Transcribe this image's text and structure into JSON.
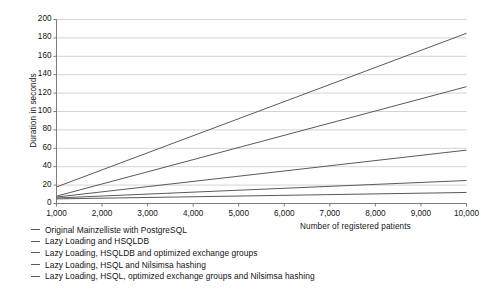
{
  "chart_data": {
    "type": "line",
    "title": "",
    "xlabel": "Number of registered patients",
    "ylabel": "Duration in seconds",
    "xlim": [
      1000,
      10000
    ],
    "ylim": [
      0,
      200
    ],
    "grid": true,
    "legend_position": "below",
    "xticks": [
      "1,000",
      "2,000",
      "3,000",
      "4,000",
      "5,000",
      "6,000",
      "7,000",
      "8,000",
      "9,000",
      "10,000"
    ],
    "xtick_values": [
      1000,
      2000,
      3000,
      4000,
      5000,
      6000,
      7000,
      8000,
      9000,
      10000
    ],
    "yticks": [
      "0",
      "20",
      "40",
      "60",
      "80",
      "100",
      "120",
      "140",
      "160",
      "180",
      "200"
    ],
    "ytick_values": [
      0,
      20,
      40,
      60,
      80,
      100,
      120,
      140,
      160,
      180,
      200
    ],
    "x": [
      1000,
      10000
    ],
    "series": [
      {
        "name": "Original Mainzelliste with PostgreSQL",
        "values": [
          18,
          185
        ],
        "color": "#5a5a5a"
      },
      {
        "name": "Lazy Loading and HSQLDB",
        "values": [
          8,
          127
        ],
        "color": "#5a5a5a"
      },
      {
        "name": "Lazy Loading, HSQLDB and optimized exchange groups",
        "values": [
          7,
          58
        ],
        "color": "#5a5a5a"
      },
      {
        "name": "Lazy Loading, HSQL and Nilsimsa hashing",
        "values": [
          6,
          25
        ],
        "color": "#5a5a5a"
      },
      {
        "name": "Lazy Loading, HSQL, optimized exchange groups and Nilsimsa hashing",
        "values": [
          5,
          12
        ],
        "color": "#5a5a5a"
      }
    ]
  },
  "colors": {
    "line": "#5a5a5a",
    "grid": "#c8c8c8",
    "axis": "#6e6e6e",
    "text": "#141414",
    "background": "#ffffff"
  }
}
